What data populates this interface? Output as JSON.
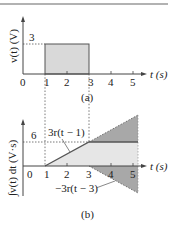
{
  "figure": {
    "top_rule": true,
    "panels": [
      {
        "id": "a",
        "caption": "(a)",
        "ylabel": "v(t) (V)",
        "xlabel": "t (s)",
        "origin_label": "0",
        "x_ticks": [
          "1",
          "2",
          "3",
          "4",
          "5"
        ],
        "y_level_label": "3",
        "pulse": {
          "start": 1,
          "end": 3,
          "value": 3
        },
        "fill_color": "#d9d9d9",
        "line_color": "#555555"
      },
      {
        "id": "b",
        "caption": "(b)",
        "ylabel": "∫v(t) dt (V·s)",
        "xlabel": "t (s)",
        "origin_label": "0",
        "x_ticks": [
          "1",
          "2",
          "3",
          "4",
          "5"
        ],
        "y_level_label": "6",
        "ramp_up_label": "3r(t − 1)",
        "ramp_down_label": "−3r(t − 3)",
        "ramp": {
          "start": 1,
          "end": 3,
          "final_value": 6
        },
        "light_fill": "#e6e6e6",
        "dark_fill": "#a8a8a8",
        "line_color": "#555555"
      }
    ]
  }
}
